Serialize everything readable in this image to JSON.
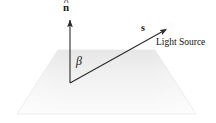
{
  "figure": {
    "background_color": "#ffffff",
    "width": 216,
    "height": 123
  },
  "labels": {
    "normal_vector": "n",
    "normal_hat_accent": "^",
    "light_vector": "s",
    "light_source_caption": "Light Source",
    "angle": "β"
  },
  "geometry": {
    "origin": {
      "x": 70,
      "y": 83
    },
    "normal_tip": {
      "x": 70,
      "y": 18
    },
    "light_tip": {
      "x": 169,
      "y": 28
    },
    "surface_top_left": {
      "x": 58,
      "y": 50
    },
    "surface_top_right": {
      "x": 155,
      "y": 50
    },
    "surface_bottom_right": {
      "x": 196,
      "y": 114
    },
    "surface_bottom_left": {
      "x": 17,
      "y": 114
    },
    "angle_arc_radius": 22
  },
  "colors": {
    "stroke": "#2b2b2b",
    "surface_fill_light": "#f4f4f4",
    "surface_fill_mid": "#ececec",
    "surface_fill_dark": "#e4e4e4",
    "surface_edge": "#e0e0e0",
    "text": "#1a1a1a"
  },
  "elements": {
    "surface_plane_name": "surface-plane",
    "normal_arrow_name": "normal-vector-arrow",
    "light_arrow_name": "light-vector-arrow",
    "angle_arc_name": "angle-arc"
  }
}
